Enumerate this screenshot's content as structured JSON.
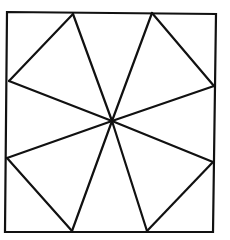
{
  "diagram": {
    "stroke_color": "#111111",
    "background": "#ffffff",
    "square": {
      "corners": [
        [
          7,
          12
        ],
        [
          216,
          14
        ],
        [
          213,
          232
        ],
        [
          5,
          232
        ]
      ]
    },
    "center": [
      112,
      121
    ],
    "edge_points": [
      [
        73,
        14
      ],
      [
        152,
        13
      ],
      [
        214,
        86
      ],
      [
        213,
        162
      ],
      [
        147,
        231
      ],
      [
        72,
        231
      ],
      [
        7,
        158
      ],
      [
        9,
        81
      ]
    ],
    "corner_triangles": [
      [
        [
          9,
          81
        ],
        [
          73,
          14
        ]
      ],
      [
        [
          152,
          13
        ],
        [
          214,
          86
        ]
      ],
      [
        [
          213,
          162
        ],
        [
          147,
          231
        ]
      ],
      [
        [
          72,
          231
        ],
        [
          7,
          158
        ]
      ]
    ]
  }
}
